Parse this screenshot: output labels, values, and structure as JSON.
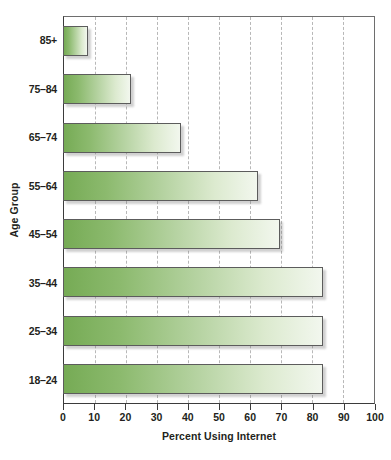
{
  "chart_data": {
    "type": "bar",
    "orientation": "horizontal",
    "title": "",
    "xlabel": "Percent Using Internet",
    "ylabel": "Age Group",
    "categories": [
      "85+",
      "75–84",
      "65–74",
      "55–64",
      "45–54",
      "35–44",
      "25–34",
      "18–24"
    ],
    "values": [
      8,
      22,
      38,
      63,
      70,
      84,
      84,
      84
    ],
    "xlim": [
      0,
      100
    ],
    "xticks": [
      0,
      10,
      20,
      30,
      40,
      50,
      60,
      70,
      80,
      90,
      100
    ],
    "xtick_labels": [
      "0",
      "10",
      "20",
      "30",
      "40",
      "50",
      "60",
      "70",
      "80",
      "90",
      "100"
    ],
    "grid": "vertical-dashed",
    "legend": "none",
    "bar_gradient_start": "#76ab55",
    "bar_gradient_end": "#f2f7ee",
    "bar_border_color": "#5c5c5c",
    "axis_color": "#3b3b3b",
    "gridline_color": "#b8b8b8",
    "background": "#ffffff"
  }
}
